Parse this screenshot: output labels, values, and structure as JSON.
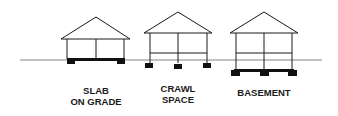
{
  "diagram": {
    "type": "foundation-types",
    "colors": {
      "line": "#1a1a1a",
      "ground": "#555555",
      "fill": "#111111",
      "background": "#ffffff"
    },
    "houses": [
      {
        "id": "slab",
        "label_lines": [
          "SLAB",
          "ON GRADE"
        ]
      },
      {
        "id": "crawl",
        "label_lines": [
          "CRAWL",
          "SPACE"
        ]
      },
      {
        "id": "basement",
        "label_lines": [
          "BASEMENT"
        ]
      }
    ]
  }
}
